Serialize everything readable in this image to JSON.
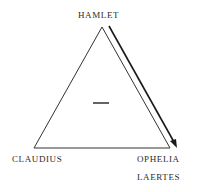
{
  "diagram": {
    "type": "triangle-relation",
    "nodes": {
      "top": "HAMLET",
      "bottom_left": "CLAUDIUS",
      "bottom_right_1": "OPHELIA",
      "bottom_right_2": "LAERTES"
    },
    "center_sign": "—",
    "center_sign_meaning": "minus",
    "arrow": {
      "from": "HAMLET",
      "to": "OPHELIA / LAERTES",
      "side": "right"
    },
    "colors": {
      "line": "#333333",
      "arrow": "#1a1a1a",
      "text": "#2b2b2b"
    }
  }
}
